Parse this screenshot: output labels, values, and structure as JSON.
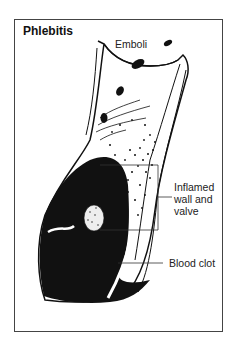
{
  "title": "Phlebitis",
  "labels": {
    "emboli": "Emboli",
    "inflamed_line1": "Inflamed",
    "inflamed_line2": "wall and",
    "inflamed_line3": "valve",
    "blood_clot": "Blood clot"
  },
  "colors": {
    "ink": "#111111",
    "frame": "#444444",
    "background": "#ffffff"
  }
}
